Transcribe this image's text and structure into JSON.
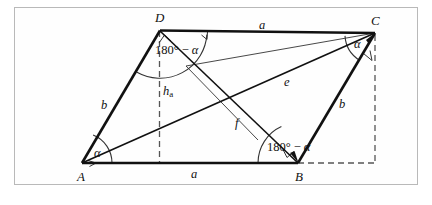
{
  "figure": {
    "vertices": {
      "A": "A",
      "B": "B",
      "C": "C",
      "D": "D"
    },
    "sides": {
      "top": "a",
      "bottom": "a",
      "left": "b",
      "right": "b"
    },
    "diagonals": {
      "e": "e",
      "f": "f"
    },
    "height": {
      "main": "h",
      "subscript": "a"
    },
    "angles": {
      "at_A": "α",
      "at_C": "α",
      "at_D_value": "180°",
      "at_D_minus": "−",
      "at_D_alpha": "α",
      "at_B_value": "180°",
      "at_B_minus": "−",
      "at_B_alpha": "α"
    },
    "colors": {
      "stroke": "#111111",
      "thin_stroke": "#333333",
      "dashed": "#555555",
      "frame": "#b9b9b9",
      "background": "#ffffff"
    }
  }
}
